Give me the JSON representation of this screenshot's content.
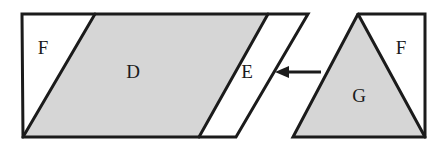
{
  "figure": {
    "title": "Area dissection diagram: parallelogram with triangles",
    "background_color": "#ffffff",
    "stroke_color": "#1b1b1b",
    "shaded_fill": "#d6d6d6",
    "unshaded_fill": "#ffffff",
    "stroke_width": 3,
    "left_shape": {
      "name": "outer-parallelogram",
      "outline_points": "22,14 308,14 236,137 23,137",
      "regions": [
        {
          "key": "region-f-left",
          "label": "F",
          "fill": "#ffffff",
          "points": "22,14 95,14 23,137",
          "label_x": 43,
          "label_y": 50
        },
        {
          "key": "region-d",
          "label": "D",
          "fill": "#d6d6d6",
          "points": "95,14 268,14 199,137 23,137",
          "label_x": 133,
          "label_y": 74
        },
        {
          "key": "region-e",
          "label": "E",
          "fill": "#ffffff",
          "points": "268,14 308,14 236,137 199,137",
          "label_x": 247,
          "label_y": 74
        }
      ]
    },
    "right_shape": {
      "name": "outer-right-figure",
      "outline_points": "358,14 425,14 425,137 293,137",
      "regions": [
        {
          "key": "region-g",
          "label": "G",
          "fill": "#d6d6d6",
          "points": "358,14 425,137 293,137",
          "label_x": 359,
          "label_y": 98
        },
        {
          "key": "region-f-right",
          "label": "F",
          "fill": "#ffffff",
          "points": "358,14 425,14 425,137",
          "label_x": 401,
          "label_y": 50
        }
      ]
    },
    "arrow": {
      "name": "left-pointing-arrow",
      "direction": "left",
      "tip_x": 275,
      "tail_x": 321,
      "y": 72,
      "head_length": 13,
      "head_half_width": 7,
      "shaft_width": 3
    }
  }
}
